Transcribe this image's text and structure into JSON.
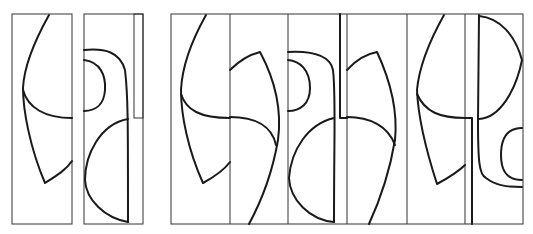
{
  "figure": {
    "background": "#ffffff",
    "stroke_color": "#1a1a1a",
    "frame_color": "#333333",
    "left_panels": [
      {
        "id": "strip-a",
        "x": 11,
        "y": 14,
        "w": 61,
        "h": 210
      },
      {
        "id": "strip-b",
        "x": 84,
        "y": 14,
        "w": 59,
        "h": 210
      }
    ],
    "composite": {
      "x": 171,
      "y": 14,
      "w": 352,
      "h": 210,
      "dividers": [
        230,
        288,
        347,
        407,
        465
      ]
    }
  }
}
